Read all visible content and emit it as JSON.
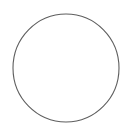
{
  "canvas": {
    "width": 140,
    "height": 135,
    "background_color": "#ffffff",
    "description": "Blank white canvas containing a single unfilled circle outline"
  },
  "shapes": [
    {
      "name": "circle-outline",
      "type": "circle",
      "center_x": 66,
      "center_y": 68,
      "radius_x": 53,
      "radius_y": 54,
      "stroke_color": "#5e5e5e",
      "stroke_width": 1.1,
      "fill": "none",
      "label": ""
    }
  ],
  "text": {
    "labels": []
  }
}
